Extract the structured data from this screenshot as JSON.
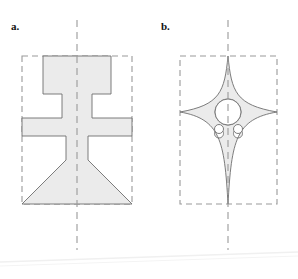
{
  "figure": {
    "panels": [
      {
        "id": "a",
        "label": "a.",
        "shape_name": "goblet-profile-outline",
        "bbox": {
          "x": 22,
          "y": 56,
          "width": 110,
          "height": 148
        },
        "centerline": {
          "x": 77,
          "y_top": 20,
          "y_bottom": 250
        },
        "holes": []
      },
      {
        "id": "b",
        "label": "b.",
        "shape_name": "four-point-concave-star-outline",
        "bbox": {
          "x": 180,
          "y": 56,
          "width": 97,
          "height": 148
        },
        "centerline": {
          "x": 228,
          "y_top": 20,
          "y_bottom": 250
        },
        "holes": [
          {
            "name": "center-large-hole",
            "cx": 228,
            "cy": 112,
            "r": 13
          },
          {
            "name": "small-hole-left",
            "cx": 219,
            "cy": 129,
            "r": 4.5
          },
          {
            "name": "small-hole-right",
            "cx": 238,
            "cy": 129,
            "r": 4.5
          }
        ]
      }
    ],
    "style": {
      "fill": "#ebebeb",
      "outline": "#6e6e6e",
      "dash_color": "#9a9a9a",
      "centerline_color": "#9a9a9a",
      "background": "#ffffff",
      "artifact_line": "#f0f0f0"
    },
    "geometry": {
      "panel_a_outline": "M 43,56 L 111,56 L 111,94 L 92,94 L 92,118 L 132,118 L 132,136 L 88,136 L 88,160 L 132,204 L 22,204 L 66,160 L 66,136 L 22,136 L 22,118 L 62,118 L 62,94 L 43,94 Z",
      "panel_b_outline": "M 228,56 C 232,96 237,107 277,112 C 237,117 232,128 228,204 C 224,128 219,117 180,112 C 219,107 224,96 228,56 Z"
    }
  }
}
